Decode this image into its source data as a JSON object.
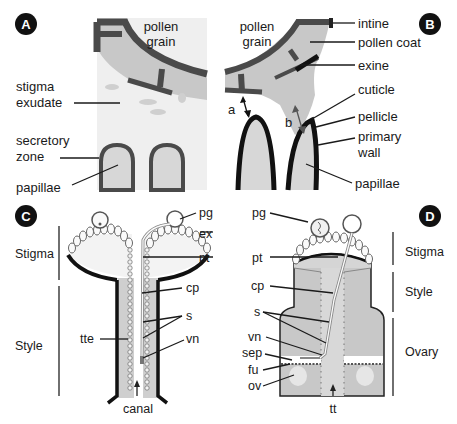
{
  "colors": {
    "background": "#ffffff",
    "exine_dark": "#4a4a4a",
    "coat_gray": "#c8c8c8",
    "light_gray": "#e6e6e6",
    "cuticle_black": "#111111",
    "mid_gray": "#b4b4b4",
    "badge": "#111111"
  },
  "panels": {
    "A": {
      "badge": "A",
      "labels": {
        "pollen_grain_1": "pollen",
        "pollen_grain_2": "grain",
        "stigma_exudate_1": "stigma",
        "stigma_exudate_2": "exudate",
        "secretory_zone_1": "secretory",
        "secretory_zone_2": "zone",
        "papillae": "papillae"
      }
    },
    "B": {
      "badge": "B",
      "labels": {
        "pollen_grain_1": "pollen",
        "pollen_grain_2": "grain",
        "intine": "intine",
        "pollen_coat": "pollen coat",
        "exine": "exine",
        "cuticle": "cuticle",
        "pellicle": "pellicle",
        "primary_wall_1": "primary",
        "primary_wall_2": "wall",
        "papillae": "papillae",
        "arrow_a": "a",
        "arrow_b": "b"
      }
    },
    "C": {
      "badge": "C",
      "labels": {
        "stigma": "Stigma",
        "style": "Style",
        "pg": "pg",
        "ex": "ex",
        "pt": "pt",
        "cp": "cp",
        "s": "s",
        "tte": "tte",
        "vn": "vn",
        "canal": "canal"
      }
    },
    "D": {
      "badge": "D",
      "labels": {
        "pg": "pg",
        "pt": "pt",
        "cp": "cp",
        "s": "s",
        "vn": "vn",
        "sep": "sep",
        "fu": "fu",
        "ov": "ov",
        "tt": "tt",
        "stigma": "Stigma",
        "style": "Style",
        "ovary": "Ovary"
      }
    }
  }
}
